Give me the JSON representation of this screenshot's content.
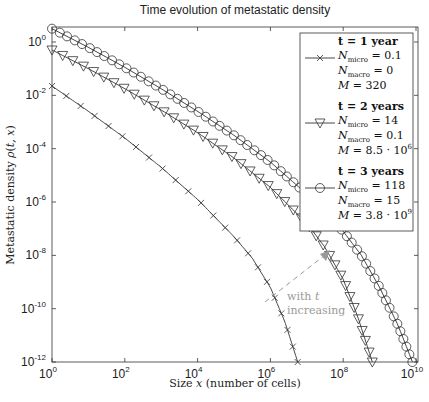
{
  "chart_data": {
    "type": "line",
    "title": "Time evolution of metastatic density",
    "xlabel": "Size x (number of cells)",
    "ylabel": "Metastatic density ρ(t, x)",
    "xscale": "log",
    "yscale": "log",
    "xlim": [
      1,
      10000000000.0
    ],
    "ylim": [
      1e-12,
      3.6
    ],
    "x_ticks": [
      {
        "base": "10",
        "exp": "0"
      },
      {
        "base": "10",
        "exp": "2"
      },
      {
        "base": "10",
        "exp": "4"
      },
      {
        "base": "10",
        "exp": "6"
      },
      {
        "base": "10",
        "exp": "8"
      },
      {
        "base": "10",
        "exp": "10"
      }
    ],
    "y_ticks": [
      {
        "base": "10",
        "exp": "0"
      },
      {
        "base": "10",
        "exp": "-2"
      },
      {
        "base": "10",
        "exp": "-4"
      },
      {
        "base": "10",
        "exp": "-6"
      },
      {
        "base": "10",
        "exp": "-8"
      },
      {
        "base": "10",
        "exp": "-10"
      },
      {
        "base": "10",
        "exp": "-12"
      }
    ],
    "grid": false,
    "legend_position": "upper right",
    "series": [
      {
        "name": "t = 1 year",
        "marker": "x",
        "details": [
          "N_micro = 0.1",
          "N_macro = 0",
          "M = 320"
        ],
        "log10_points": [
          [
            0,
            -1.65
          ],
          [
            1,
            -2.6
          ],
          [
            2,
            -3.6
          ],
          [
            3,
            -4.7
          ],
          [
            4,
            -5.9
          ],
          [
            5,
            -7.3
          ],
          [
            5.5,
            -8.1
          ],
          [
            6,
            -9.2
          ],
          [
            6.4,
            -10.5
          ],
          [
            6.75,
            -12
          ]
        ]
      },
      {
        "name": "t = 2 years",
        "marker": "triangle-down",
        "details": [
          "N_micro = 14",
          "N_macro = 0.1",
          "M = 8.5 · 10^6"
        ],
        "log10_points": [
          [
            0,
            -0.3
          ],
          [
            1,
            -1.0
          ],
          [
            2,
            -1.75
          ],
          [
            3,
            -2.55
          ],
          [
            4,
            -3.4
          ],
          [
            5,
            -4.35
          ],
          [
            6,
            -5.45
          ],
          [
            7,
            -6.8
          ],
          [
            7.5,
            -7.7
          ],
          [
            8,
            -8.9
          ],
          [
            8.4,
            -10.3
          ],
          [
            8.8,
            -12
          ]
        ]
      },
      {
        "name": "t = 3 years",
        "marker": "circle",
        "details": [
          "N_micro = 118",
          "N_macro = 15",
          "M = 3.8 · 10^9"
        ],
        "log10_points": [
          [
            0,
            0.5
          ],
          [
            1,
            -0.2
          ],
          [
            2,
            -0.95
          ],
          [
            3,
            -1.75
          ],
          [
            4,
            -2.6
          ],
          [
            5,
            -3.5
          ],
          [
            6,
            -4.5
          ],
          [
            7,
            -5.7
          ],
          [
            8,
            -7.1
          ],
          [
            8.5,
            -8.0
          ],
          [
            9,
            -9.2
          ],
          [
            9.5,
            -10.6
          ],
          [
            9.9,
            -12
          ]
        ]
      }
    ],
    "annotations": [
      {
        "text_lines": [
          "with t",
          "increasing"
        ],
        "arrow": "dashed gray, pointing toward increasing t"
      }
    ]
  },
  "legend": {
    "entries": [
      {
        "heading": "t = 1 year",
        "micro": "= 0.1",
        "macro": "= 0",
        "m": "= 320",
        "m_exp": ""
      },
      {
        "heading": "t = 2 years",
        "micro": "= 14",
        "macro": "= 0.1",
        "m": "= 8.5 · 10",
        "m_exp": "6"
      },
      {
        "heading": "t = 3 years",
        "micro": "= 118",
        "macro": "= 15",
        "m": "= 3.8 · 10",
        "m_exp": "9"
      }
    ],
    "n_label": "N",
    "micro_sub": "micro",
    "macro_sub": "macro",
    "m_label": "M"
  },
  "annotation": {
    "line1": "with ",
    "line1_var": "t",
    "line2": "increasing"
  }
}
